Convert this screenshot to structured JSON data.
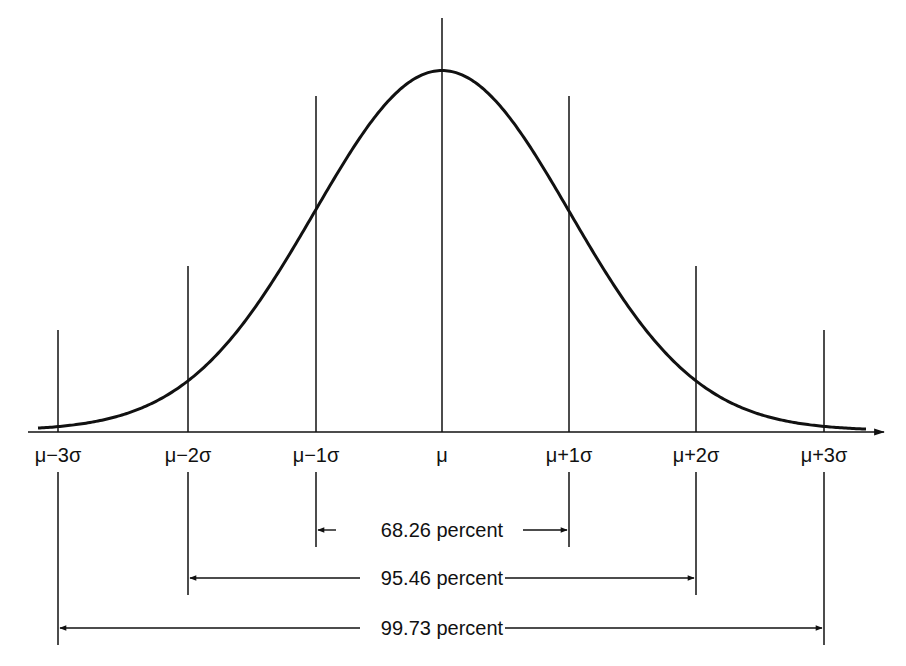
{
  "figure": {
    "stroke_color": "#111111",
    "background": "#ffffff"
  },
  "axis": {
    "ticks": [
      {
        "id": "m3",
        "label": "μ−3σ",
        "sigma": -3
      },
      {
        "id": "m2",
        "label": "μ−2σ",
        "sigma": -2
      },
      {
        "id": "m1",
        "label": "μ−1σ",
        "sigma": -1
      },
      {
        "id": "mu",
        "label": "μ",
        "sigma": 0
      },
      {
        "id": "p1",
        "label": "μ+1σ",
        "sigma": 1
      },
      {
        "id": "p2",
        "label": "μ+2σ",
        "sigma": 2
      },
      {
        "id": "p3",
        "label": "μ+3σ",
        "sigma": 3
      }
    ]
  },
  "brackets": [
    {
      "id": "one-sigma",
      "label": "68.26 percent",
      "from": -1,
      "to": 1
    },
    {
      "id": "two-sigma",
      "label": "95.46 percent",
      "from": -2,
      "to": 2
    },
    {
      "id": "three-sigma",
      "label": "99.73 percent",
      "from": -3,
      "to": 3
    }
  ],
  "chart_data": {
    "type": "line",
    "xlabel": "",
    "ylabel": "",
    "x": [
      -3,
      -2,
      -1,
      0,
      1,
      2,
      3
    ],
    "categories": [
      "μ−3σ",
      "μ−2σ",
      "μ−1σ",
      "μ",
      "μ+1σ",
      "μ+2σ",
      "μ+3σ"
    ],
    "values": [
      0.0044,
      0.054,
      0.242,
      0.399,
      0.242,
      0.054,
      0.0044
    ],
    "annotations": [
      {
        "range": [
          "μ−1σ",
          "μ+1σ"
        ],
        "text": "68.26 percent"
      },
      {
        "range": [
          "μ−2σ",
          "μ+2σ"
        ],
        "text": "95.46 percent"
      },
      {
        "range": [
          "μ−3σ",
          "μ+3σ"
        ],
        "text": "99.73 percent"
      }
    ],
    "grid": false,
    "legend": "none"
  }
}
